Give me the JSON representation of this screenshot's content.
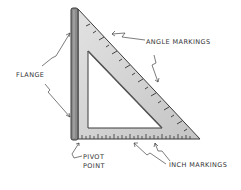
{
  "diagram": {
    "labels": {
      "flange": "FLANGE",
      "angle_markings": "ANGLE MARKINGS",
      "pivot_line1": "PIVOT",
      "pivot_line2": "POINT",
      "inch_markings": "INCH MARKINGS"
    },
    "colors": {
      "body": "#d4d4d4",
      "flange": "#8a8a8a",
      "outline": "#3a3a3a",
      "text": "#333333"
    }
  }
}
